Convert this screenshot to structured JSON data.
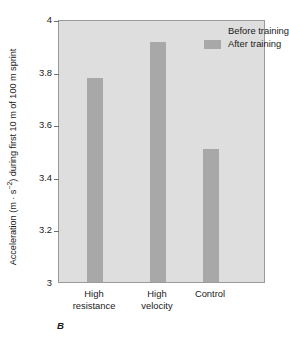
{
  "panel_letter": "B",
  "legend": {
    "position": "top-right-inside",
    "entries": [
      {
        "label": "Before training",
        "swatch": "before",
        "color": "#dedede"
      },
      {
        "label": "After training",
        "swatch": "after",
        "color": "#a8a8a8"
      }
    ]
  },
  "axis": {
    "y_title_main": "Acceleration (m · s",
    "y_title_sup": "−2",
    "y_title_tail": ") during first 10 m of 100 m sprint",
    "y_title_full": "Acceleration (m · s−2) during first 10 m of 100 m sprint",
    "y_ticks": [
      "4",
      "3.8",
      "3.6",
      "3.4",
      "3.2",
      "3"
    ]
  },
  "chart_data": {
    "type": "bar",
    "title": "",
    "subtitle": "",
    "xlabel": "",
    "ylabel": "Acceleration (m · s−2) during first 10 m of 100 m sprint",
    "categories": [
      "High resistance",
      "High velocity",
      "Control"
    ],
    "category_lines": [
      [
        "High",
        "resistance"
      ],
      [
        "High",
        "velocity"
      ],
      [
        "Control"
      ]
    ],
    "series": [
      {
        "name": "Before training",
        "values": [
          null,
          null,
          null
        ],
        "color": "#dedede",
        "note": "not plotted / same tone as panel background"
      },
      {
        "name": "After training",
        "values": [
          3.78,
          3.92,
          3.51
        ],
        "color": "#a8a8a8"
      }
    ],
    "ylim": [
      3,
      4
    ],
    "ytick_values": [
      4,
      3.8,
      3.6,
      3.4,
      3.2,
      3
    ],
    "grid": false,
    "legend_entries": [
      "Before training",
      "After training"
    ],
    "annotations": [
      "B"
    ],
    "plot_background": "#dedede",
    "figure_background": "#ffffff"
  }
}
